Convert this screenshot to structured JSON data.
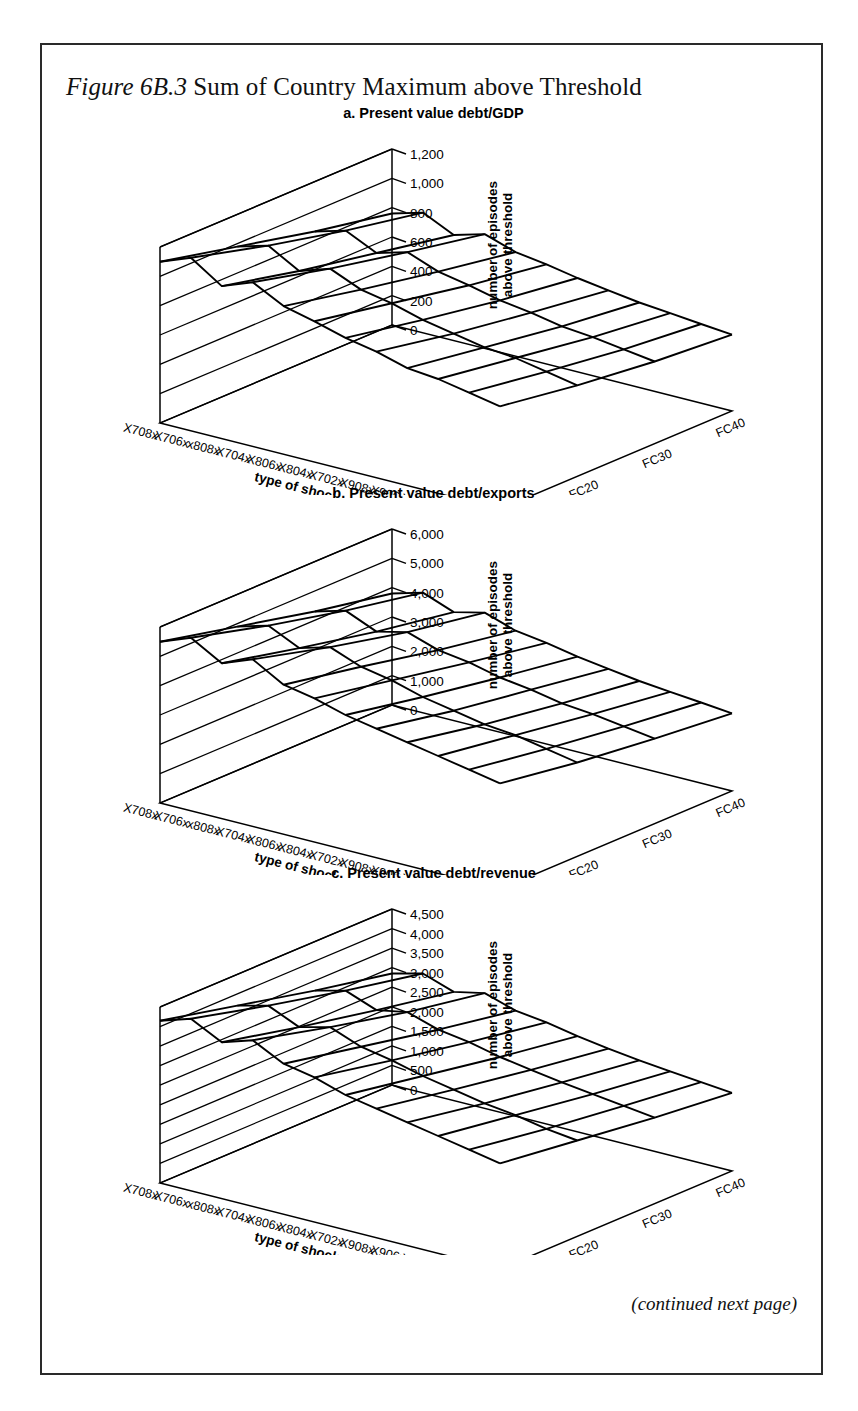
{
  "figure": {
    "number": "Figure 6B.3",
    "title_rest": "Sum of Country Maximum above Threshold",
    "footer": "(continued next page)"
  },
  "axis_titles": {
    "x": "type of shock",
    "y": "number of episodes above threshold"
  },
  "shock_categories": [
    "X708x",
    "X706x",
    "x808x",
    "X704x",
    "X806x",
    "X804x",
    "X702x",
    "X908x",
    "X906x",
    "X802x",
    "X904x",
    "X902x"
  ],
  "fc_categories": [
    "FC10",
    "FC20",
    "FC30",
    "FC40"
  ],
  "panels": [
    {
      "key": "a",
      "title": "a. Present value debt/GDP",
      "yticks": [
        "0",
        "200",
        "400",
        "600",
        "800",
        "1,000",
        "1,200"
      ]
    },
    {
      "key": "b",
      "title": "b. Present value debt/exports",
      "yticks": [
        "0",
        "1,000",
        "2,000",
        "3,000",
        "4,000",
        "5,000",
        "6,000"
      ]
    },
    {
      "key": "c",
      "title": "c. Present value debt/revenue",
      "yticks": [
        "0",
        "500",
        "1,000",
        "1,500",
        "2,000",
        "2,500",
        "3,000",
        "3,500",
        "4,000",
        "4,500"
      ]
    }
  ],
  "chart_data": [
    {
      "type": "line",
      "subplot": "a",
      "title": "a. Present value debt/GDP",
      "render": "3d-wireframe-surface",
      "xlabel": "type of shock",
      "ylabel": "number of episodes above threshold",
      "zlabel": "",
      "ylim": [
        0,
        1200
      ],
      "ytick_step": 200,
      "grid": true,
      "legend": "none",
      "categories": [
        "X708x",
        "X706x",
        "x808x",
        "X704x",
        "X806x",
        "X804x",
        "X702x",
        "X908x",
        "X906x",
        "X802x",
        "X904x",
        "X902x"
      ],
      "depth_categories": [
        "FC10",
        "FC20",
        "FC30",
        "FC40"
      ],
      "series": [
        {
          "name": "FC10",
          "values": [
            1100,
            1180,
            1040,
            1120,
            1010,
            960,
            900,
            860,
            800,
            780,
            740,
            700
          ]
        },
        {
          "name": "FC20",
          "values": [
            980,
            1040,
            920,
            990,
            900,
            860,
            800,
            760,
            720,
            700,
            660,
            620
          ]
        },
        {
          "name": "FC30",
          "values": [
            860,
            920,
            820,
            880,
            800,
            760,
            710,
            680,
            640,
            620,
            590,
            560
          ]
        },
        {
          "name": "FC40",
          "values": [
            760,
            820,
            720,
            780,
            710,
            680,
            640,
            610,
            580,
            560,
            540,
            520
          ]
        }
      ]
    },
    {
      "type": "line",
      "subplot": "b",
      "title": "b. Present value debt/exports",
      "render": "3d-wireframe-surface",
      "xlabel": "type of shock",
      "ylabel": "number of episodes above threshold",
      "zlabel": "",
      "ylim": [
        0,
        6000
      ],
      "ytick_step": 1000,
      "grid": true,
      "legend": "none",
      "categories": [
        "X708x",
        "X706x",
        "x808x",
        "X704x",
        "X806x",
        "X804x",
        "X702x",
        "X908x",
        "X906x",
        "X802x",
        "X904x",
        "X902x"
      ],
      "depth_categories": [
        "FC10",
        "FC20",
        "FC30",
        "FC40"
      ],
      "series": [
        {
          "name": "FC10",
          "values": [
            5500,
            5900,
            5300,
            5700,
            5100,
            4900,
            4600,
            4400,
            4200,
            4000,
            3800,
            3600
          ]
        },
        {
          "name": "FC20",
          "values": [
            4900,
            5200,
            4700,
            5000,
            4600,
            4400,
            4100,
            3900,
            3700,
            3600,
            3400,
            3200
          ]
        },
        {
          "name": "FC30",
          "values": [
            4300,
            4600,
            4150,
            4400,
            4050,
            3900,
            3650,
            3500,
            3300,
            3200,
            3050,
            2900
          ]
        },
        {
          "name": "FC40",
          "values": [
            3800,
            4100,
            3700,
            3950,
            3600,
            3450,
            3250,
            3100,
            2950,
            2850,
            2750,
            2650
          ]
        }
      ]
    },
    {
      "type": "line",
      "subplot": "c",
      "title": "c. Present value debt/revenue",
      "render": "3d-wireframe-surface",
      "xlabel": "type of shock",
      "ylabel": "number of episodes above threshold",
      "zlabel": "",
      "ylim": [
        0,
        4500
      ],
      "ytick_step": 500,
      "grid": true,
      "legend": "none",
      "categories": [
        "X708x",
        "X706x",
        "x808x",
        "X704x",
        "X806x",
        "X804x",
        "X702x",
        "X908x",
        "X906x",
        "X802x",
        "X904x",
        "X902x"
      ],
      "depth_categories": [
        "FC10",
        "FC20",
        "FC30",
        "FC40"
      ],
      "series": [
        {
          "name": "FC10",
          "values": [
            4150,
            4400,
            4000,
            4250,
            3850,
            3700,
            3450,
            3300,
            3150,
            3000,
            2850,
            2700
          ]
        },
        {
          "name": "FC20",
          "values": [
            3700,
            3900,
            3550,
            3750,
            3450,
            3300,
            3100,
            2950,
            2800,
            2700,
            2550,
            2450
          ]
        },
        {
          "name": "FC30",
          "values": [
            3250,
            3450,
            3150,
            3300,
            3050,
            2930,
            2750,
            2620,
            2500,
            2400,
            2300,
            2200
          ]
        },
        {
          "name": "FC40",
          "values": [
            2850,
            3050,
            2780,
            2950,
            2700,
            2600,
            2450,
            2330,
            2230,
            2150,
            2070,
            2000
          ]
        }
      ]
    }
  ]
}
